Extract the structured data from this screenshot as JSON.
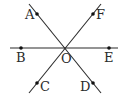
{
  "diagram": {
    "type": "geometry",
    "colors": {
      "line": "#2b2b2b",
      "point": "#111111",
      "background": "#ffffff"
    },
    "lines": [
      {
        "id": "AD",
        "x1": 29,
        "y1": 4,
        "x2": 101,
        "y2": 93
      },
      {
        "id": "FC",
        "x1": 101,
        "y1": 4,
        "x2": 29,
        "y2": 93
      },
      {
        "id": "BE",
        "x1": 10,
        "y1": 48,
        "x2": 118,
        "y2": 48
      }
    ],
    "points": [
      {
        "name": "A",
        "x": 37,
        "y": 14,
        "label": "A",
        "lx": 25,
        "ly": 19
      },
      {
        "name": "F",
        "x": 93,
        "y": 14,
        "label": "F",
        "lx": 96,
        "ly": 19
      },
      {
        "name": "B",
        "x": 21,
        "y": 48,
        "label": "B",
        "lx": 16,
        "ly": 62
      },
      {
        "name": "E",
        "x": 109,
        "y": 48,
        "label": "E",
        "lx": 104,
        "ly": 62
      },
      {
        "name": "C",
        "x": 37,
        "y": 83,
        "label": "C",
        "lx": 40,
        "ly": 91
      },
      {
        "name": "D",
        "x": 93,
        "y": 83,
        "label": "D",
        "lx": 80,
        "ly": 91
      }
    ],
    "center": {
      "name": "O",
      "x": 64,
      "y": 48,
      "label": "O",
      "lx": 61,
      "ly": 63
    }
  }
}
